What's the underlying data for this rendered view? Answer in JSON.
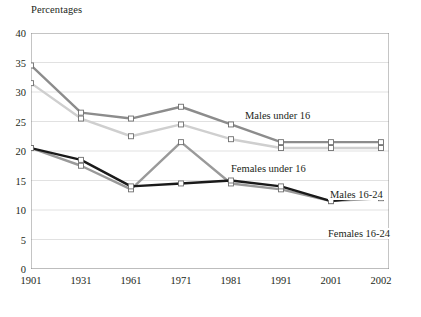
{
  "chart_data": {
    "type": "line",
    "title": "Percentages",
    "xlabel": "",
    "ylabel": "",
    "categories": [
      "1901",
      "1931",
      "1961",
      "1971",
      "1981",
      "1991",
      "2001",
      "2002"
    ],
    "ylim": [
      0,
      40
    ],
    "y_ticks": [
      0,
      5,
      10,
      15,
      20,
      25,
      30,
      35,
      40
    ],
    "grid": "horizontal",
    "legend_position": "inline-annotations",
    "series": [
      {
        "name": "Males under 16",
        "color": "#8c8c8c",
        "values": [
          34.5,
          26.5,
          25.5,
          27.5,
          24.5,
          21.5,
          21.5,
          21.5
        ]
      },
      {
        "name": "Females under 16",
        "color": "#cfcfcf",
        "values": [
          31.5,
          25.5,
          22.5,
          24.5,
          22.0,
          20.5,
          20.5,
          20.5
        ]
      },
      {
        "name": "Males 16-24",
        "color": "#9a9a9a",
        "values": [
          20.5,
          17.5,
          13.5,
          21.5,
          14.5,
          13.5,
          11.5,
          12.0
        ]
      },
      {
        "name": "Females 16-24",
        "color": "#1a1a1a",
        "values": [
          20.5,
          18.5,
          14.0,
          14.5,
          15.0,
          14.0,
          11.5,
          12.5
        ]
      }
    ],
    "annotations": [
      {
        "text": "Males under 16",
        "x_px": 243,
        "y_px": 110
      },
      {
        "text": "Females under 16",
        "x_px": 229,
        "y_px": 163
      },
      {
        "text": "Males 16-24",
        "x_px": 328,
        "y_px": 189
      },
      {
        "text": "Females 16-24",
        "x_px": 326,
        "y_px": 228
      }
    ],
    "style": {
      "axis_color": "#8a8a8a",
      "grid_color": "#d9d9d9",
      "marker_fill": "#ffffff",
      "marker_size_px": 5,
      "plot_background": "#ffffff"
    }
  }
}
